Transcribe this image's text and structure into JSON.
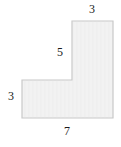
{
  "figure": {
    "shape_name": "l-shaped-polygon",
    "fill_color": "#f2f2f2",
    "stroke_color": "#c8c8c8",
    "background_color": "#ffffff",
    "label_color": "#1a1a1a",
    "outline_points": "22,80 72,80 72,21 113,21 113,118 22,118",
    "labels": {
      "top": "3",
      "inner_vertical": "5",
      "left": "3",
      "bottom": "7"
    }
  },
  "chart_data": {
    "type": "diagram",
    "title": "",
    "shape": "L-shaped polygon",
    "dimension_labels": [
      {
        "name": "top-width",
        "value": 3,
        "text": "3",
        "position": "top"
      },
      {
        "name": "inner-vertical-height",
        "value": 5,
        "text": "5",
        "position": "interior-left-of-vertical-edge"
      },
      {
        "name": "left-height",
        "value": 3,
        "text": "3",
        "position": "left"
      },
      {
        "name": "bottom-width",
        "value": 7,
        "text": "7",
        "position": "bottom"
      }
    ]
  }
}
